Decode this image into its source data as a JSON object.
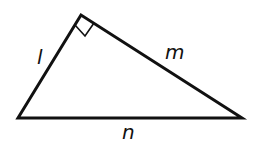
{
  "diagram": {
    "type": "right-triangle",
    "vertices": {
      "top": [
        81,
        15
      ],
      "bottom_left": [
        18,
        118
      ],
      "bottom_right": [
        242,
        118
      ]
    },
    "right_angle_at": "top",
    "sides": [
      {
        "name": "left",
        "label": "l"
      },
      {
        "name": "right",
        "label": "m"
      },
      {
        "name": "bottom",
        "label": "n"
      }
    ],
    "stroke_color": "#111111",
    "background": "#ffffff"
  }
}
